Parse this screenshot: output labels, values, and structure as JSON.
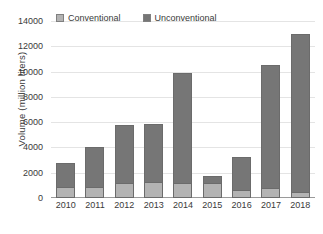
{
  "chart_data": {
    "type": "bar",
    "subtype": "stacked-vertical",
    "title": "",
    "xlabel": "",
    "ylabel": "Volume (million liters)",
    "categories": [
      "2010",
      "2011",
      "2012",
      "2013",
      "2014",
      "2015",
      "2016",
      "2017",
      "2018"
    ],
    "series": [
      {
        "name": "Conventional",
        "color": "#b3b3b3",
        "values": [
          880,
          850,
          1180,
          1230,
          1170,
          1200,
          660,
          830,
          450
        ]
      },
      {
        "name": "Unconventional",
        "color": "#767676",
        "values": [
          1870,
          3200,
          4620,
          4600,
          8680,
          520,
          2560,
          9720,
          12500
        ]
      }
    ],
    "totals": [
      2750,
      4050,
      5800,
      5830,
      9850,
      1720,
      3220,
      10550,
      12950
    ],
    "ylim": [
      0,
      14000
    ],
    "y_ticks": [
      0,
      2000,
      4000,
      6000,
      8000,
      10000,
      12000,
      14000
    ],
    "y_tick_labels": [
      "0",
      "2000",
      "4000",
      "6000",
      "8000",
      "10000",
      "12000",
      "14000"
    ],
    "grid": true,
    "grid_axis": "y",
    "legend": {
      "position": "top",
      "entries": [
        {
          "label": "Conventional",
          "color": "#b3b3b3"
        },
        {
          "label": "Unconventional",
          "color": "#767676"
        }
      ]
    },
    "colors": {
      "conventional": "#b3b3b3",
      "unconventional": "#767676",
      "bar_border": "#6b6b6b",
      "gridline": "#e4e4e4",
      "axis": "#9a9a9a",
      "text": "#3a3a3a",
      "background": "#ffffff"
    }
  }
}
